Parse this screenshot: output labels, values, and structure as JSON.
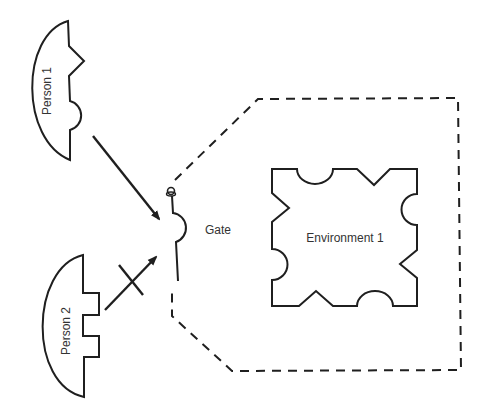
{
  "diagram": {
    "colors": {
      "stroke": "#1f1f1f",
      "text": "#333333",
      "background": "#ffffff"
    },
    "nodes": {
      "person1": {
        "label": "Person 1",
        "connector": "triangle-notch + round-bump"
      },
      "person2": {
        "label": "Person 2",
        "connector": "square-tabs"
      },
      "gate": {
        "label": "Gate",
        "connector": "round-bump"
      },
      "environment1": {
        "label": "Environment 1",
        "connector": "mixed round + triangle"
      }
    },
    "edges": [
      {
        "from": "Person 1",
        "to": "Gate",
        "style": "arrow",
        "blocked": false
      },
      {
        "from": "Person 2",
        "to": "Gate",
        "style": "arrow",
        "blocked": true,
        "marker": "X"
      }
    ],
    "boundary": {
      "style": "dashed",
      "encloses": "Environment 1"
    }
  }
}
